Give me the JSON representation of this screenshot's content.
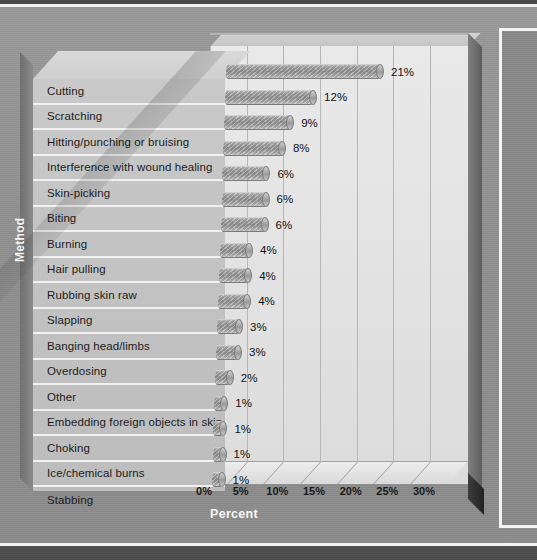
{
  "chart_data": {
    "type": "bar",
    "orientation": "horizontal",
    "title": "",
    "xlabel": "Percent",
    "ylabel": "Method",
    "categories": [
      "Cutting",
      "Scratching",
      "Hitting/punching or bruising",
      "Interference with wound healing",
      "Skin-picking",
      "Biting",
      "Burning",
      "Hair pulling",
      "Rubbing skin raw",
      "Slapping",
      "Banging head/limbs",
      "Overdosing",
      "Other",
      "Embedding foreign objects in skin",
      "Choking",
      "Ice/chemical burns",
      "Stabbing"
    ],
    "values": [
      21,
      12,
      9,
      8,
      6,
      6,
      6,
      4,
      4,
      4,
      3,
      3,
      2,
      1,
      1,
      1,
      1
    ],
    "data_labels": [
      "21%",
      "12%",
      "9%",
      "8%",
      "6%",
      "6%",
      "6%",
      "4%",
      "4%",
      "4%",
      "3%",
      "3%",
      "2%",
      "1%",
      "1%",
      "1%",
      "1%"
    ],
    "xticks": [
      0,
      5,
      10,
      15,
      20,
      25,
      30
    ],
    "xtick_labels": [
      "0%",
      "5%",
      "10%",
      "15%",
      "20%",
      "25%",
      "30%"
    ],
    "xlim": [
      0,
      33
    ],
    "grid": true,
    "legend": false,
    "style": "3d-cylinder-bar"
  },
  "colors": {
    "page_background": "#8e8e8e",
    "plot_background": "#e5e5e5",
    "bar_fill": "#9f9f9f",
    "label_panel": "#c4c4c4",
    "gridline": "#b6b6b6",
    "axis_title": "#f6f6f6",
    "rule": "#f2f2f2"
  },
  "footer": {
    "caption": ""
  }
}
